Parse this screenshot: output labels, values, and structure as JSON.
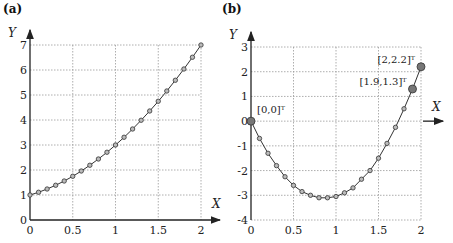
{
  "chart_data": [
    {
      "type": "line",
      "panel_label": "(a)",
      "xlabel": "X",
      "ylabel": "Y",
      "xlim": [
        0,
        2
      ],
      "ylim": [
        0,
        7
      ],
      "xticks": [
        "0",
        "0.5",
        "1",
        "1.5",
        "2"
      ],
      "yticks": [
        "0",
        "1",
        "2",
        "3",
        "4",
        "5",
        "6",
        "7"
      ],
      "grid": true,
      "x": [
        0,
        0.1,
        0.2,
        0.3,
        0.4,
        0.5,
        0.6,
        0.7,
        0.8,
        0.9,
        1.0,
        1.1,
        1.2,
        1.3,
        1.4,
        1.5,
        1.6,
        1.7,
        1.8,
        1.9,
        2.0
      ],
      "y": [
        1,
        1.11,
        1.24,
        1.39,
        1.56,
        1.75,
        1.96,
        2.19,
        2.44,
        2.71,
        3,
        3.31,
        3.64,
        3.99,
        4.36,
        4.75,
        5.16,
        5.59,
        6.04,
        6.51,
        7
      ],
      "annotations": []
    },
    {
      "type": "line",
      "panel_label": "(b)",
      "xlabel": "X",
      "ylabel": "Y",
      "xlim": [
        0,
        2
      ],
      "ylim": [
        -4,
        3
      ],
      "xticks": [
        "0",
        "0.5",
        "1",
        "1.5",
        "2"
      ],
      "yticks": [
        "-4",
        "-3",
        "-2",
        "-1",
        "0",
        "1",
        "2",
        "3"
      ],
      "grid": true,
      "x": [
        0,
        0.1,
        0.2,
        0.3,
        0.4,
        0.5,
        0.6,
        0.7,
        0.8,
        0.9,
        1.0,
        1.1,
        1.2,
        1.3,
        1.4,
        1.5,
        1.6,
        1.7,
        1.8,
        1.9,
        2.0
      ],
      "y": [
        0,
        -0.7,
        -1.3,
        -1.8,
        -2.25,
        -2.6,
        -2.85,
        -3.0,
        -3.1,
        -3.1,
        -3.05,
        -2.9,
        -2.7,
        -2.35,
        -2.0,
        -1.5,
        -0.9,
        -0.25,
        0.5,
        1.3,
        2.2
      ],
      "annotations": [
        {
          "text": "[0,0]ᵀ",
          "x": 0,
          "y": 0
        },
        {
          "text": "[1.9,1.3]ᵀ",
          "x": 1.9,
          "y": 1.3
        },
        {
          "text": "[2,2.2]ᵀ",
          "x": 2,
          "y": 2.2
        }
      ]
    }
  ]
}
